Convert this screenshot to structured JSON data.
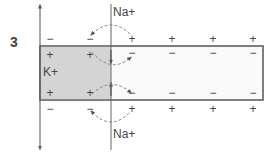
{
  "diagram": {
    "step_number": "3",
    "labels": {
      "intracellular_ion": "K+",
      "top_influx_ion": "Na+",
      "bottom_influx_ion": "Na+"
    },
    "colors": {
      "depolarized_fill": "#d4d4d4",
      "resting_fill": "#fafafa",
      "outline": "#777777",
      "text": "#444444"
    },
    "charges": {
      "outside_top": [
        "−",
        "−",
        "+",
        "+",
        "+",
        "+"
      ],
      "inside_top": [
        "+",
        "+",
        "−",
        "−",
        "−",
        "−"
      ],
      "inside_bottom": [
        "+",
        "+",
        "−",
        "−",
        "−",
        "−"
      ],
      "outside_bottom": [
        "−",
        "−",
        "+",
        "+",
        "+",
        "+"
      ]
    }
  }
}
